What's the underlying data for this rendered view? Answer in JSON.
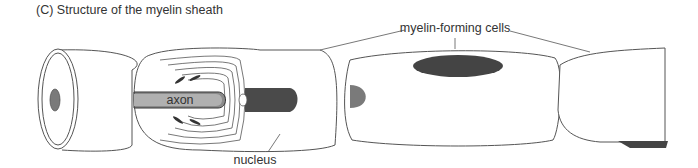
{
  "figure": {
    "title": "(C)  Structure of the myelin sheath"
  },
  "labels": {
    "axon": "axon",
    "nucleus": "nucleus",
    "myelin_forming_cells": "myelin-forming cells"
  },
  "colors": {
    "outline": "#555555",
    "cell_fill": "#ffffff",
    "axon_fill": "#b0b0b0",
    "axon_core": "#8a8a8a",
    "nucleus_fill": "#4a4a4a",
    "node_fill": "#7a7a7a"
  }
}
